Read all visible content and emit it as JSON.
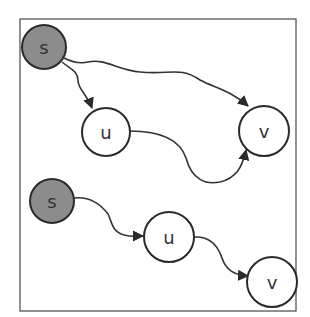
{
  "diagram": {
    "type": "directed-graph",
    "colors": {
      "source_fill": "#8c8c8c",
      "node_fill": "#ffffff",
      "stroke": "#2a2a2a"
    },
    "top_graph": {
      "nodes": [
        {
          "id": "s",
          "label": "s",
          "kind": "source"
        },
        {
          "id": "u",
          "label": "u",
          "kind": "normal"
        },
        {
          "id": "v",
          "label": "v",
          "kind": "normal"
        }
      ],
      "edges": [
        {
          "from": "s",
          "to": "u"
        },
        {
          "from": "s",
          "to": "v"
        },
        {
          "from": "u",
          "to": "v"
        }
      ]
    },
    "bottom_graph": {
      "nodes": [
        {
          "id": "s",
          "label": "s",
          "kind": "source"
        },
        {
          "id": "u",
          "label": "u",
          "kind": "normal"
        },
        {
          "id": "v",
          "label": "v",
          "kind": "normal"
        }
      ],
      "edges": [
        {
          "from": "s",
          "to": "u"
        },
        {
          "from": "u",
          "to": "v"
        }
      ]
    }
  }
}
